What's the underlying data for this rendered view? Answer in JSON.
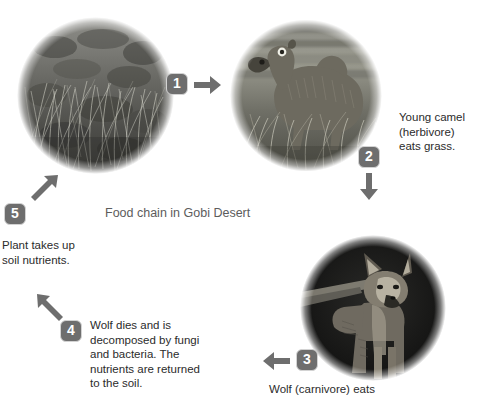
{
  "diagram": {
    "title": "Food chain in Gobi Desert",
    "background_color": "#ffffff",
    "badge_color": "#6e6e6e",
    "arrow_color": "#6e6e6e",
    "text_color": "#2b2b2b",
    "title_color": "#5c5c5c"
  },
  "photos": [
    {
      "id": "grass",
      "alt": "grass"
    },
    {
      "id": "camel",
      "alt": "young camel"
    },
    {
      "id": "wolf",
      "alt": "wolf"
    }
  ],
  "steps": [
    {
      "number": "1",
      "arrow": "arrow-right-icon",
      "caption": ""
    },
    {
      "number": "2",
      "arrow": "arrow-down-icon",
      "caption": "Young camel\n(herbivore)\neats grass."
    },
    {
      "number": "3",
      "arrow": "arrow-left-icon",
      "caption": "Wolf (carnivore) eats"
    },
    {
      "number": "4",
      "arrow": "arrow-up-left-icon",
      "caption": "Wolf dies and is\ndecomposed by fungi\nand bacteria. The\nnutrients are returned\nto the soil."
    },
    {
      "number": "5",
      "arrow": "arrow-up-right-icon",
      "caption": "Plant takes up\nsoil nutrients."
    }
  ]
}
